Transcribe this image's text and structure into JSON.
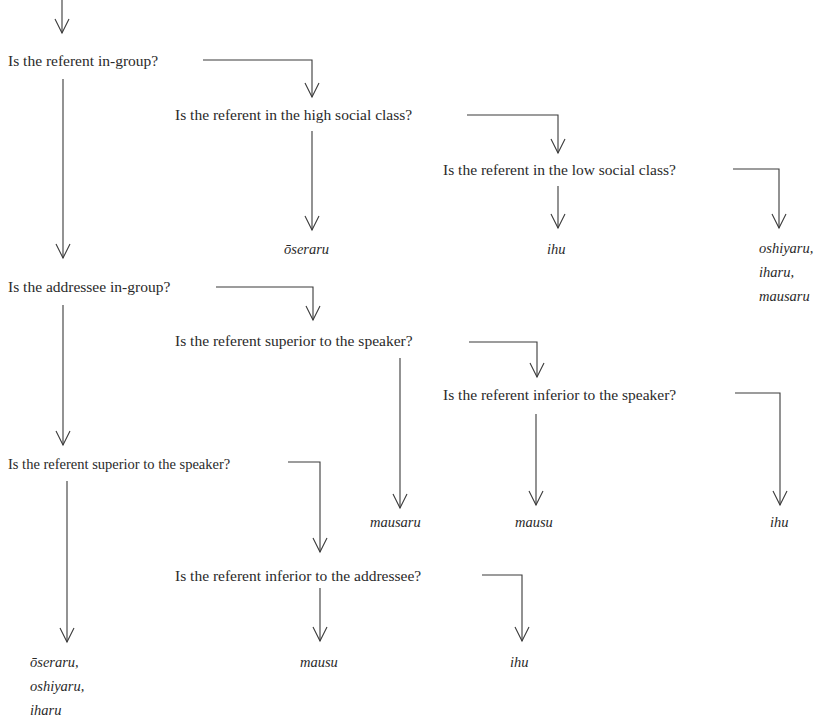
{
  "diagram": {
    "type": "decision-tree",
    "questions": [
      {
        "id": "q1",
        "label": "Is the referent in-group?"
      },
      {
        "id": "q2",
        "label": "Is the referent in the high social class?"
      },
      {
        "id": "q3",
        "label": "Is the referent in the low social class?"
      },
      {
        "id": "q4",
        "label": "Is the addressee in-group?"
      },
      {
        "id": "q5",
        "label": "Is the referent superior to the speaker?"
      },
      {
        "id": "q6",
        "label": "Is the referent inferior to the speaker?"
      },
      {
        "id": "q7",
        "label": "Is the referent superior to the speaker?"
      },
      {
        "id": "q8",
        "label": "Is the referent inferior to the addressee?"
      }
    ],
    "terminals": [
      {
        "id": "t1",
        "from": "q2",
        "lines": [
          "ōseraru"
        ]
      },
      {
        "id": "t2",
        "from": "q3",
        "lines": [
          "ihu"
        ]
      },
      {
        "id": "t3",
        "from": "q3",
        "lines": [
          "oshiyaru,",
          "iharu,",
          "mausaru"
        ]
      },
      {
        "id": "t4",
        "from": "q5",
        "lines": [
          "mausaru"
        ]
      },
      {
        "id": "t5",
        "from": "q6",
        "lines": [
          "mausu"
        ]
      },
      {
        "id": "t6",
        "from": "q6",
        "lines": [
          "ihu"
        ]
      },
      {
        "id": "t7",
        "from": "q7",
        "lines": [
          "ōseraru,",
          "oshiyaru,",
          "iharu"
        ]
      },
      {
        "id": "t8",
        "from": "q8",
        "lines": [
          "mausu"
        ]
      },
      {
        "id": "t9",
        "from": "q8",
        "lines": [
          "ihu"
        ]
      }
    ],
    "edges": [
      {
        "from": "start",
        "to": "q1"
      },
      {
        "from": "q1",
        "to": "q4",
        "branch": "down"
      },
      {
        "from": "q1",
        "to": "q2",
        "branch": "right"
      },
      {
        "from": "q2",
        "to": "t1",
        "branch": "down"
      },
      {
        "from": "q2",
        "to": "q3",
        "branch": "right"
      },
      {
        "from": "q3",
        "to": "t2",
        "branch": "down"
      },
      {
        "from": "q3",
        "to": "t3",
        "branch": "right"
      },
      {
        "from": "q4",
        "to": "q7",
        "branch": "down"
      },
      {
        "from": "q4",
        "to": "q5",
        "branch": "right"
      },
      {
        "from": "q5",
        "to": "t4",
        "branch": "down"
      },
      {
        "from": "q5",
        "to": "q6",
        "branch": "right"
      },
      {
        "from": "q6",
        "to": "t5",
        "branch": "down"
      },
      {
        "from": "q6",
        "to": "t6",
        "branch": "right"
      },
      {
        "from": "q7",
        "to": "t7",
        "branch": "down"
      },
      {
        "from": "q7",
        "to": "q8",
        "branch": "right"
      },
      {
        "from": "q8",
        "to": "t8",
        "branch": "down"
      },
      {
        "from": "q8",
        "to": "t9",
        "branch": "right"
      }
    ],
    "colors": {
      "ink": "#2a2a2a",
      "line": "#3a3a3a",
      "background": "#ffffff"
    }
  }
}
